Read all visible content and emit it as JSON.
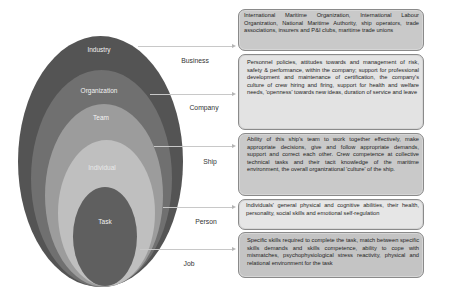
{
  "diagram": {
    "type": "nested-ellipse-model",
    "colors": {
      "industry": "#545454",
      "organization": "#707070",
      "team": "#9c9c9c",
      "individual": "#bfbfbf",
      "task": "#5f5f5f",
      "connector": "#c8c8c8"
    },
    "layers": [
      {
        "label": "Industry"
      },
      {
        "label": "Organization"
      },
      {
        "label": "Team"
      },
      {
        "label": "Individual"
      },
      {
        "label": "Task"
      }
    ],
    "levels": [
      {
        "label": "Business"
      },
      {
        "label": "Company"
      },
      {
        "label": "Ship"
      },
      {
        "label": "Person"
      },
      {
        "label": "Job"
      }
    ],
    "descriptions": [
      {
        "text": "International Maritime Organization, International Labour Organization, National Maritime Authority, ship operators, trade associations,  insurers and P&I clubs, maritime trade unions"
      },
      {
        "text": "Personnel policies, attitudes towards and management of risk, safety & performance, within the company; support for professional development and maintenance of certification, the company's culture of crew hiring and firing, support for health and welfare needs, 'openness' towards new ideas, duration of service and leave"
      },
      {
        "text": "Ability of this ship's team to work together effectively, make appropriate decisions, give and follow appropriate demands, support and correct each other. Crew competence at collective technical tasks and their tacit knowledge of the maritime environment, the overall organizational 'culture' of the ship."
      },
      {
        "text": "Individuals' general physical and cognitive abilities, their health, personality, social skills and emotional self-regulation"
      },
      {
        "text": "Specific skills required to complete the task, match between specific skills demands and skills competence, ability to cope with mismatches, psychophysiological stress reactivity, physical and relational environment for the task"
      }
    ]
  }
}
